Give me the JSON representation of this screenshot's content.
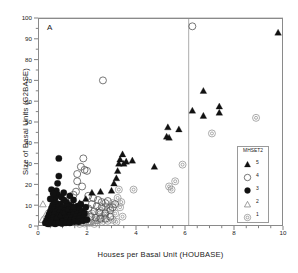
{
  "figure": {
    "panel_label": "A",
    "background": "#ffffff",
    "frame_color": "#8a8a8a"
  },
  "legend": {
    "title": "MHSET2",
    "position": "inside-bottom-right",
    "entries": [
      {
        "label": "5",
        "symbol": "filled-triangle",
        "color": "#111111"
      },
      {
        "label": "4",
        "symbol": "open-circle",
        "color": "#555555"
      },
      {
        "label": "3",
        "symbol": "filled-circle",
        "color": "#111111"
      },
      {
        "label": "2",
        "symbol": "open-triangle",
        "color": "#777777"
      },
      {
        "label": "1",
        "symbol": "double-circle",
        "color": "#888888"
      }
    ]
  },
  "chart_data": {
    "type": "scatter",
    "title": "",
    "xlabel": "Houses per Basal Unit (HOUBASE)",
    "ylabel": "Size of Basal Units (G2BASE)",
    "xlim": [
      0,
      10
    ],
    "ylim": [
      0,
      100
    ],
    "xticks": [
      0,
      2,
      4,
      6,
      8,
      10
    ],
    "yticks": [
      0,
      10,
      20,
      30,
      40,
      50,
      60,
      70,
      80,
      90,
      100
    ],
    "xminor_step": 0.5,
    "yminor_step": 5,
    "grid": false,
    "reference_lines": [
      {
        "orientation": "vertical",
        "value": 6.15,
        "color": "#8a8a8a"
      },
      {
        "orientation": "horizontal",
        "value": 100,
        "color": "#8a8a8a"
      }
    ],
    "series": [
      {
        "name": "5",
        "symbol": "filled-triangle",
        "color": "#111111",
        "points": [
          [
            9.8,
            93.0
          ],
          [
            6.75,
            65.0
          ],
          [
            6.3,
            55.5
          ],
          [
            6.75,
            53.0
          ],
          [
            7.4,
            57.5
          ],
          [
            7.4,
            54.5
          ],
          [
            5.75,
            46.5
          ],
          [
            5.3,
            47.5
          ],
          [
            5.25,
            43.0
          ],
          [
            5.35,
            42.5
          ],
          [
            4.75,
            28.5
          ],
          [
            3.85,
            31.5
          ],
          [
            3.6,
            31.0
          ],
          [
            3.45,
            34.5
          ],
          [
            3.35,
            32.0
          ],
          [
            3.5,
            30.0
          ],
          [
            3.3,
            30.0
          ],
          [
            3.25,
            26.5
          ],
          [
            3.2,
            23.0
          ],
          [
            3.1,
            20.5
          ],
          [
            3.0,
            17.0
          ],
          [
            2.55,
            16.5
          ],
          [
            2.2,
            16.0
          ],
          [
            1.95,
            13.0
          ],
          [
            1.7,
            11.0
          ],
          [
            1.45,
            9.5
          ],
          [
            1.2,
            8.0
          ],
          [
            1.05,
            6.5
          ],
          [
            0.9,
            5.0
          ],
          [
            0.75,
            4.0
          ]
        ]
      },
      {
        "name": "4",
        "symbol": "open-circle",
        "color": "#555555",
        "points": [
          [
            6.3,
            96.0
          ],
          [
            2.65,
            70.0
          ],
          [
            1.85,
            32.5
          ],
          [
            1.75,
            28.5
          ],
          [
            1.9,
            27.0
          ],
          [
            1.6,
            25.0
          ],
          [
            2.0,
            26.5
          ],
          [
            1.6,
            21.5
          ],
          [
            1.8,
            19.0
          ],
          [
            1.55,
            16.5
          ],
          [
            1.45,
            15.0
          ],
          [
            2.05,
            14.5
          ],
          [
            2.25,
            13.5
          ],
          [
            2.45,
            12.5
          ],
          [
            2.6,
            11.5
          ],
          [
            2.75,
            11.0
          ],
          [
            2.85,
            12.0
          ],
          [
            1.3,
            13.0
          ],
          [
            1.15,
            11.5
          ],
          [
            2.2,
            10.5
          ],
          [
            2.4,
            9.5
          ],
          [
            2.6,
            9.0
          ],
          [
            2.05,
            8.5
          ],
          [
            1.85,
            8.0
          ],
          [
            1.65,
            7.5
          ],
          [
            1.45,
            7.0
          ],
          [
            1.25,
            6.5
          ],
          [
            1.05,
            6.0
          ],
          [
            2.3,
            7.0
          ],
          [
            2.5,
            6.5
          ],
          [
            2.75,
            6.0
          ],
          [
            2.95,
            7.5
          ],
          [
            3.05,
            9.0
          ],
          [
            3.15,
            10.5
          ],
          [
            1.95,
            5.5
          ],
          [
            1.75,
            5.0
          ],
          [
            1.55,
            4.5
          ],
          [
            1.35,
            4.0
          ],
          [
            1.15,
            3.5
          ],
          [
            0.95,
            3.0
          ],
          [
            2.15,
            4.5
          ],
          [
            2.35,
            4.0
          ],
          [
            2.55,
            3.5
          ],
          [
            2.75,
            3.5
          ],
          [
            2.95,
            4.5
          ],
          [
            1.0,
            8.5
          ],
          [
            0.85,
            7.0
          ],
          [
            0.7,
            5.5
          ]
        ]
      },
      {
        "name": "3",
        "symbol": "filled-circle",
        "color": "#111111",
        "points": [
          [
            0.85,
            32.5
          ],
          [
            0.85,
            24.0
          ],
          [
            0.8,
            20.5
          ],
          [
            0.75,
            17.0
          ],
          [
            0.8,
            15.0
          ],
          [
            0.7,
            13.5
          ],
          [
            0.95,
            14.0
          ],
          [
            1.05,
            12.5
          ],
          [
            0.65,
            12.0
          ],
          [
            0.75,
            11.0
          ],
          [
            0.9,
            10.5
          ],
          [
            1.15,
            11.5
          ],
          [
            1.3,
            10.0
          ],
          [
            0.6,
            10.0
          ],
          [
            0.7,
            9.0
          ],
          [
            0.85,
            9.5
          ],
          [
            1.0,
            9.0
          ],
          [
            1.2,
            9.5
          ],
          [
            1.4,
            9.0
          ],
          [
            0.55,
            8.5
          ],
          [
            0.65,
            8.0
          ],
          [
            0.8,
            7.5
          ],
          [
            0.95,
            8.0
          ],
          [
            1.1,
            7.5
          ],
          [
            1.25,
            8.0
          ],
          [
            1.45,
            8.5
          ],
          [
            1.6,
            9.5
          ],
          [
            0.5,
            7.0
          ],
          [
            0.6,
            6.5
          ],
          [
            0.72,
            6.8
          ],
          [
            0.88,
            6.5
          ],
          [
            1.02,
            6.0
          ],
          [
            1.18,
            6.5
          ],
          [
            1.35,
            6.5
          ],
          [
            1.52,
            7.0
          ],
          [
            1.7,
            8.0
          ],
          [
            0.45,
            5.5
          ],
          [
            0.55,
            5.0
          ],
          [
            0.68,
            5.5
          ],
          [
            0.82,
            5.0
          ],
          [
            0.97,
            5.0
          ],
          [
            1.12,
            5.5
          ],
          [
            1.28,
            5.0
          ],
          [
            1.45,
            5.5
          ],
          [
            1.62,
            6.0
          ],
          [
            1.8,
            7.0
          ],
          [
            0.4,
            4.0
          ],
          [
            0.5,
            3.5
          ],
          [
            0.62,
            4.0
          ],
          [
            0.76,
            3.5
          ],
          [
            0.9,
            4.0
          ],
          [
            1.05,
            3.5
          ],
          [
            1.22,
            4.0
          ],
          [
            1.38,
            4.0
          ],
          [
            1.55,
            4.5
          ],
          [
            1.72,
            5.0
          ],
          [
            1.9,
            6.0
          ],
          [
            0.35,
            2.5
          ],
          [
            0.45,
            2.0
          ],
          [
            0.58,
            2.5
          ],
          [
            0.72,
            2.0
          ],
          [
            0.86,
            2.5
          ],
          [
            1.0,
            2.0
          ],
          [
            1.16,
            2.5
          ],
          [
            1.32,
            2.5
          ],
          [
            1.5,
            3.0
          ],
          [
            1.68,
            3.5
          ],
          [
            1.86,
            4.0
          ],
          [
            0.3,
            1.5
          ],
          [
            0.42,
            1.0
          ],
          [
            0.56,
            1.5
          ],
          [
            0.7,
            1.0
          ],
          [
            0.84,
            1.5
          ],
          [
            0.98,
            1.2
          ],
          [
            1.14,
            1.5
          ],
          [
            1.3,
            1.5
          ],
          [
            1.48,
            2.0
          ],
          [
            1.66,
            2.0
          ],
          [
            1.84,
            2.5
          ],
          [
            2.0,
            3.0
          ],
          [
            0.55,
            17.5
          ],
          [
            0.62,
            15.5
          ],
          [
            0.5,
            13.0
          ],
          [
            1.45,
            12.5
          ],
          [
            1.05,
            16.0
          ],
          [
            1.3,
            14.5
          ],
          [
            1.75,
            10.5
          ],
          [
            1.95,
            9.0
          ]
        ]
      },
      {
        "name": "2",
        "symbol": "open-triangle",
        "color": "#777777",
        "points": [
          [
            0.2,
            10.5
          ],
          [
            0.18,
            3.0
          ],
          [
            0.35,
            6.0
          ],
          [
            0.55,
            4.5
          ],
          [
            0.75,
            2.0
          ],
          [
            1.0,
            1.5
          ],
          [
            1.25,
            2.0
          ],
          [
            1.5,
            1.5
          ],
          [
            1.8,
            1.5
          ],
          [
            2.1,
            2.0
          ],
          [
            2.4,
            2.5
          ],
          [
            0.45,
            1.0
          ]
        ]
      },
      {
        "name": "1",
        "symbol": "double-circle",
        "color": "#888888",
        "points": [
          [
            8.9,
            52.0
          ],
          [
            7.1,
            44.5
          ],
          [
            5.9,
            29.5
          ],
          [
            5.6,
            21.5
          ],
          [
            5.35,
            19.0
          ],
          [
            5.45,
            17.5
          ],
          [
            3.9,
            17.5
          ],
          [
            3.3,
            17.5
          ],
          [
            3.25,
            13.5
          ],
          [
            3.4,
            11.5
          ],
          [
            3.35,
            9.0
          ],
          [
            3.45,
            4.5
          ],
          [
            3.05,
            11.0
          ],
          [
            2.95,
            8.5
          ],
          [
            2.8,
            7.0
          ],
          [
            3.15,
            6.0
          ],
          [
            2.7,
            5.0
          ],
          [
            2.55,
            4.0
          ],
          [
            2.4,
            3.0
          ],
          [
            2.25,
            2.5
          ],
          [
            2.6,
            2.0
          ],
          [
            2.85,
            2.5
          ],
          [
            3.05,
            3.0
          ],
          [
            2.1,
            1.5
          ],
          [
            1.9,
            1.2
          ],
          [
            1.7,
            1.0
          ],
          [
            2.3,
            1.0
          ],
          [
            3.2,
            2.0
          ],
          [
            2.75,
            9.5
          ],
          [
            2.5,
            7.5
          ],
          [
            2.2,
            6.0
          ],
          [
            1.95,
            4.5
          ]
        ]
      }
    ]
  }
}
